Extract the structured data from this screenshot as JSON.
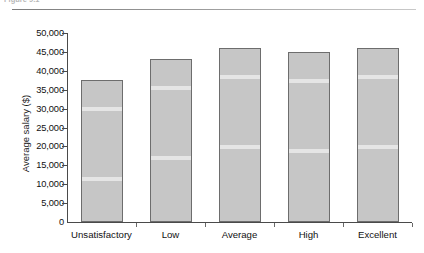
{
  "figure": {
    "caption": "Figure 9.1",
    "caption_visible": false
  },
  "chart_data": {
    "type": "bar",
    "title": "",
    "subtitle": "",
    "xlabel": "",
    "ylabel": "Average salary ($)",
    "categories": [
      "Unsatisfactory",
      "Low",
      "Average",
      "High",
      "Excellent"
    ],
    "values": [
      37500,
      43000,
      46000,
      45000,
      46000
    ],
    "ylim": [
      0,
      50000
    ],
    "yticks": [
      0,
      5000,
      10000,
      15000,
      20000,
      25000,
      30000,
      35000,
      40000,
      45000,
      50000
    ],
    "ytick_labels": [
      "0",
      "5,000",
      "10,000",
      "15,000",
      "20,000",
      "25,000",
      "30,000",
      "35,000",
      "40,000",
      "45,000",
      "50,000"
    ],
    "grid": false,
    "legend": null,
    "legend_position": "none",
    "bar_color": "#c6c6c6",
    "bar_border_color": "#6d6d6d",
    "axis_color": "#4a4a4a"
  }
}
